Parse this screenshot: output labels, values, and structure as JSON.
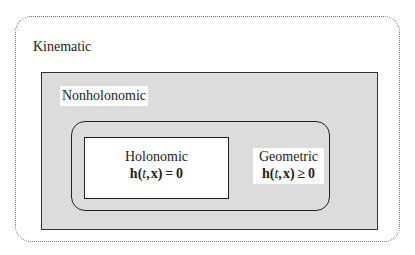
{
  "diagram": {
    "outer": {
      "label": "Kinematic"
    },
    "middle": {
      "label": "Nonholonomic",
      "fill": "#dcdcdc"
    },
    "holonomic": {
      "label": "Holonomic",
      "equation": "h(t, x) = 0"
    },
    "geometric": {
      "label": "Geometric",
      "equation": "h(t, x) ≥ 0"
    }
  }
}
